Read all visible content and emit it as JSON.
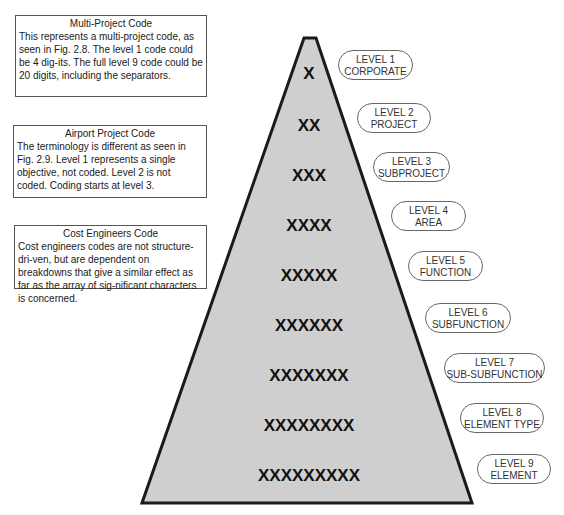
{
  "notes": [
    {
      "title": "Multi-Project Code",
      "body": "This represents a multi-project code, as seen in Fig. 2.8. The level 1 code could be 4 dig-its. The full level 9 code could be 20 digits, including the separators."
    },
    {
      "title": "Airport Project Code",
      "body": "The terminology  is different as seen in Fig. 2.9.  Level 1 represents a single objective, not coded. Level 2 is not coded. Coding starts at level 3."
    },
    {
      "title": "Cost Engineers Code",
      "body": "Cost engineers codes are not structure-dri-ven, but are dependent on breakdowns that give a similar effect as far as the array of sig-nificant characters is concerned."
    }
  ],
  "pyramid": {
    "fill_color": "#cfcfcf",
    "stroke_color": "#1a1a1a",
    "rows": [
      "X",
      "XX",
      "XXX",
      "XXXX",
      "XXXXX",
      "XXXXXX",
      "XXXXXXX",
      "XXXXXXXX",
      "XXXXXXXXX"
    ]
  },
  "levels": [
    {
      "level": "LEVEL 1",
      "name": "CORPORATE"
    },
    {
      "level": "LEVEL 2",
      "name": "PROJECT"
    },
    {
      "level": "LEVEL 3",
      "name": "SUBPROJECT"
    },
    {
      "level": "LEVEL 4",
      "name": "AREA"
    },
    {
      "level": "LEVEL 5",
      "name": "FUNCTION"
    },
    {
      "level": "LEVEL 6",
      "name": "SUBFUNCTION"
    },
    {
      "level": "LEVEL 7",
      "name": "SUB-SUBFUNCTION"
    },
    {
      "level": "LEVEL 8",
      "name": "ELEMENT TYPE"
    },
    {
      "level": "LEVEL 9",
      "name": "ELEMENT"
    }
  ]
}
